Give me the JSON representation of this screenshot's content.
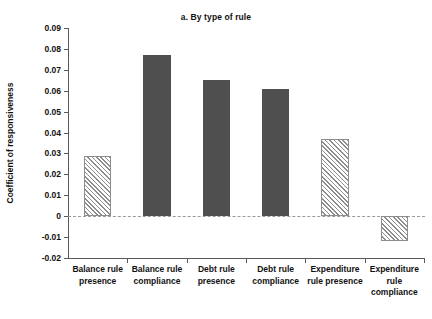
{
  "chart_data": {
    "type": "bar",
    "title": "a. By type of rule",
    "xlabel": "",
    "ylabel": "Coefficient of responsiveness",
    "categories": [
      "Balance rule\npresence",
      "Balance rule\ncompliance",
      "Debt rule\npresence",
      "Debt rule\ncompliance",
      "Expenditure\nrule presence",
      "Expenditure\nrule\ncompliance"
    ],
    "values": [
      0.029,
      0.077,
      0.065,
      0.061,
      0.037,
      -0.012
    ],
    "bar_styles": [
      "hatch",
      "solid",
      "solid",
      "solid",
      "hatch",
      "hatch"
    ],
    "ylim": [
      -0.02,
      0.09
    ],
    "ytick_values": [
      0.09,
      0.08,
      0.07,
      0.06,
      0.05,
      0.04,
      0.03,
      0.02,
      0.01,
      0,
      -0.01,
      -0.02
    ],
    "ytick_labels": [
      "0.09",
      "0.08",
      "0.07",
      "0.06",
      "0.05",
      "0.04",
      "0.03",
      "0.02",
      "0.01",
      "0",
      "-0.01",
      "-0.02"
    ],
    "grid": false,
    "zero_line": true,
    "legend": [],
    "colors": {
      "solid_bar": "#4f4f4f",
      "hatch_line": "#8d8d8d",
      "axis": "#5a5a5a",
      "zero_line": "#9a9a9a",
      "text": "#111111",
      "background": "#ffffff"
    }
  }
}
